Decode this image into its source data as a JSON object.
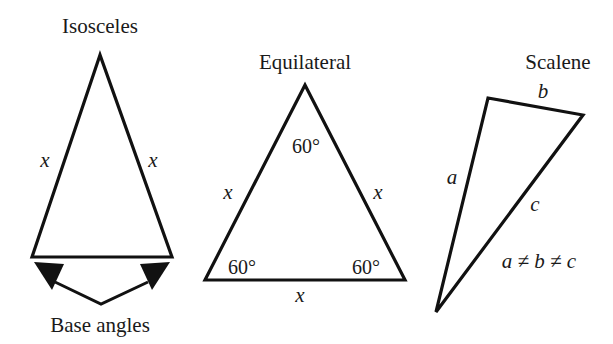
{
  "diagram": {
    "stroke_color": "#111111",
    "background": "#ffffff",
    "triangles": [
      {
        "type": "isosceles",
        "title": "Isosceles",
        "vertices": [
          [
            100,
            55
          ],
          [
            32,
            257
          ],
          [
            172,
            257
          ]
        ],
        "side_labels": [
          "x",
          "x"
        ],
        "annotation": "Base angles"
      },
      {
        "type": "equilateral",
        "title": "Equilateral",
        "vertices": [
          [
            305,
            85
          ],
          [
            205,
            280
          ],
          [
            405,
            280
          ]
        ],
        "side_labels": [
          "x",
          "x",
          "x"
        ],
        "angle_labels": [
          "60°",
          "60°",
          "60°"
        ]
      },
      {
        "type": "scalene",
        "title": "Scalene",
        "vertices": [
          [
            488,
            98
          ],
          [
            583,
            115
          ],
          [
            436,
            312
          ]
        ],
        "side_labels": [
          "a",
          "b",
          "c"
        ],
        "relation": "a ≠ b ≠ c"
      }
    ]
  }
}
